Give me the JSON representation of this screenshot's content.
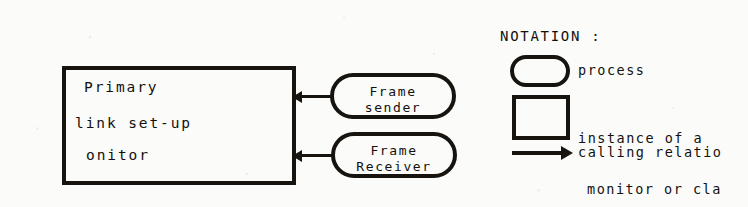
{
  "diagram": {
    "type": "process-monitor-architecture-diagram",
    "monitor_box": {
      "name": "primary-link-set-up-monitor",
      "lines": [
        "Primary",
        "link set-up",
        "onitor"
      ]
    },
    "processes": [
      {
        "id": "frame-sender",
        "line1": "Frame",
        "line2": "sender"
      },
      {
        "id": "frame-receiver",
        "line1": "Frame",
        "line2": "Receiver"
      }
    ],
    "arrows": [
      {
        "id": "frame-sender-to-monitor",
        "direction": "left",
        "relation": "calling"
      },
      {
        "id": "frame-receiver-to-monitor",
        "direction": "left",
        "relation": "calling"
      }
    ]
  },
  "notation": {
    "title": "NOTATION :",
    "entries": [
      {
        "symbol": "rounded-oval",
        "label": "process"
      },
      {
        "symbol": "rectangle",
        "label_line1": "instance of a",
        "label_line2": "monitor or cla"
      },
      {
        "symbol": "right-arrow",
        "label": "calling relatio"
      }
    ]
  },
  "colors": {
    "ink": "#17140f",
    "paper": "#fbfbf9"
  }
}
